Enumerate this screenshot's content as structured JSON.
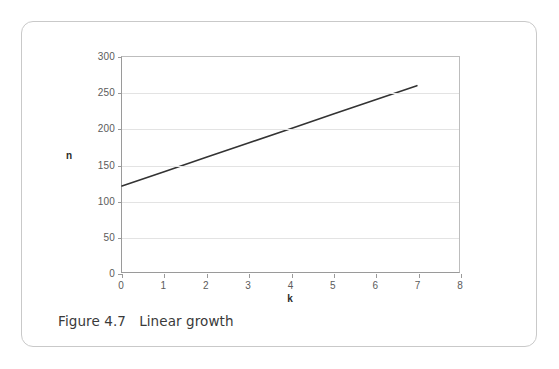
{
  "figure": {
    "caption": "Figure 4.7   Linear growth"
  },
  "chart_data": {
    "type": "line",
    "title": "",
    "subtitle": "",
    "xlabel": "k",
    "ylabel": "n",
    "xlim": [
      0,
      8
    ],
    "ylim": [
      0,
      300
    ],
    "xticks": [
      0,
      1,
      2,
      3,
      4,
      5,
      6,
      7,
      8
    ],
    "xtick_labels": [
      "0",
      "1",
      "2",
      "3",
      "4",
      "5",
      "6",
      "7",
      "8"
    ],
    "yticks": [
      0,
      50,
      100,
      150,
      200,
      250,
      300
    ],
    "ytick_labels": [
      "0",
      "50",
      "100",
      "150",
      "200",
      "250",
      "300"
    ],
    "grid": {
      "horizontal": true,
      "vertical": false,
      "color": "#e3e3e3"
    },
    "legend": {
      "visible": false,
      "position": "none"
    },
    "series": [
      {
        "name": "n = 120 + 20k",
        "color": "#333333",
        "line_width": 1.6,
        "x": [
          0,
          1,
          2,
          3,
          4,
          5,
          6,
          7
        ],
        "values": [
          120,
          140,
          160,
          180,
          200,
          220,
          240,
          260
        ]
      }
    ],
    "axis_color": "#9a9a9a",
    "plot_background": "#ffffff"
  },
  "colors": {
    "card_border": "#c9c9c9",
    "tick_text": "#5b5b5b",
    "axis_label_text": "#2b2b2b",
    "caption_text": "#3a3a3a",
    "series_line": "#333333",
    "gridline": "#e3e3e3"
  }
}
